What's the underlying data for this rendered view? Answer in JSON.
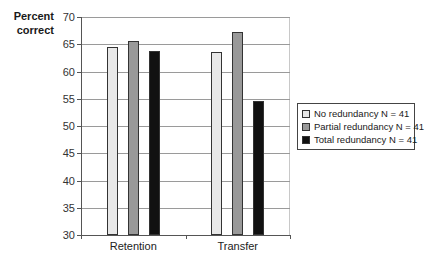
{
  "chart_data": {
    "type": "bar",
    "title": "",
    "ylabel": "Percent correct",
    "xlabel": "",
    "ylim": [
      30,
      70
    ],
    "yticks": [
      30,
      35,
      40,
      45,
      50,
      55,
      60,
      65,
      70
    ],
    "grid": true,
    "legend_position": "right",
    "categories": [
      "Retention",
      "Transfer"
    ],
    "series": [
      {
        "name": "No redundancy N = 41",
        "color": "#e8e8e8",
        "values": [
          64.5,
          63.6
        ]
      },
      {
        "name": "Partial redundancy N = 41",
        "color": "#999999",
        "values": [
          65.6,
          67.3
        ]
      },
      {
        "name": "Total redundancy N = 41",
        "color": "#111111",
        "values": [
          63.7,
          54.5
        ]
      }
    ]
  },
  "labels": {
    "ytitle_line1": "Percent",
    "ytitle_line2": "correct"
  }
}
